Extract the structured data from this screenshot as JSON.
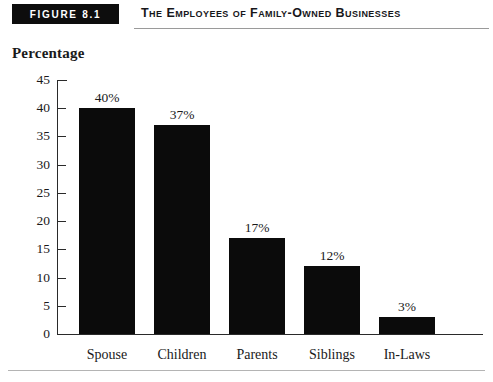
{
  "figure": {
    "badge_label": "FIGURE 8.1",
    "title": "The Employees of Family-Owned Businesses"
  },
  "chart_data": {
    "type": "bar",
    "title": "The Employees of Family-Owned Businesses",
    "xlabel": "",
    "ylabel": "Percentage",
    "categories": [
      "Spouse",
      "Children",
      "Parents",
      "Siblings",
      "In-Laws"
    ],
    "values": [
      40,
      37,
      17,
      12,
      3
    ],
    "value_labels": [
      "40%",
      "37%",
      "17%",
      "12%",
      "3%"
    ],
    "ylim": [
      0,
      45
    ],
    "y_ticks": [
      0,
      5,
      10,
      15,
      20,
      25,
      30,
      35,
      40,
      45
    ],
    "y_tick_labels": [
      "0",
      "5",
      "10",
      "15",
      "20",
      "25",
      "30",
      "35",
      "40",
      "45"
    ],
    "grid": false,
    "legend": null,
    "bar_color": "#0b0b0b",
    "axis_color": "#2a2a2a"
  }
}
